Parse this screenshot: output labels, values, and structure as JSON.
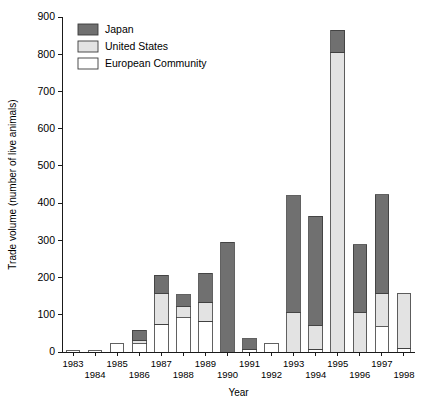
{
  "chart_data": {
    "type": "bar",
    "subtype": "stacked-vertical",
    "title": "",
    "xlabel": "Year",
    "ylabel": "Trade volume (number of live animals)",
    "ylim": [
      0,
      900
    ],
    "ytick_step": 100,
    "yticks": [
      "0",
      "100",
      "200",
      "300",
      "400",
      "500",
      "600",
      "700",
      "800",
      "900"
    ],
    "grid": false,
    "legend_position": "top-left-inside",
    "categories": [
      "1983",
      "1984",
      "1985",
      "1986",
      "1987",
      "1988",
      "1989",
      "1990",
      "1991",
      "1992",
      "1993",
      "1994",
      "1995",
      "1996",
      "1997",
      "1998"
    ],
    "series": [
      {
        "name": "European Community",
        "color": "#ffffff",
        "values": [
          4,
          5,
          22,
          22,
          74,
          92,
          82,
          0,
          8,
          22,
          0,
          8,
          0,
          0,
          68,
          10
        ]
      },
      {
        "name": "United States",
        "color": "#e3e3e3",
        "values": [
          0,
          0,
          0,
          8,
          82,
          30,
          52,
          0,
          0,
          0,
          105,
          62,
          805,
          105,
          90,
          148
        ]
      },
      {
        "name": "Japan",
        "color": "#707070",
        "values": [
          0,
          0,
          0,
          28,
          50,
          32,
          77,
          295,
          28,
          0,
          315,
          295,
          60,
          183,
          265,
          0
        ]
      }
    ],
    "totals": [
      4,
      5,
      22,
      58,
      206,
      154,
      211,
      295,
      36,
      22,
      420,
      365,
      865,
      288,
      423,
      158
    ]
  },
  "legend": {
    "entries": [
      {
        "label": "Japan",
        "color": "#707070"
      },
      {
        "label": "United States",
        "color": "#e3e3e3"
      },
      {
        "label": "European Community",
        "color": "#ffffff"
      }
    ]
  },
  "axes": {
    "y_title": "Trade volume (number of live animals)",
    "x_title": "Year"
  }
}
